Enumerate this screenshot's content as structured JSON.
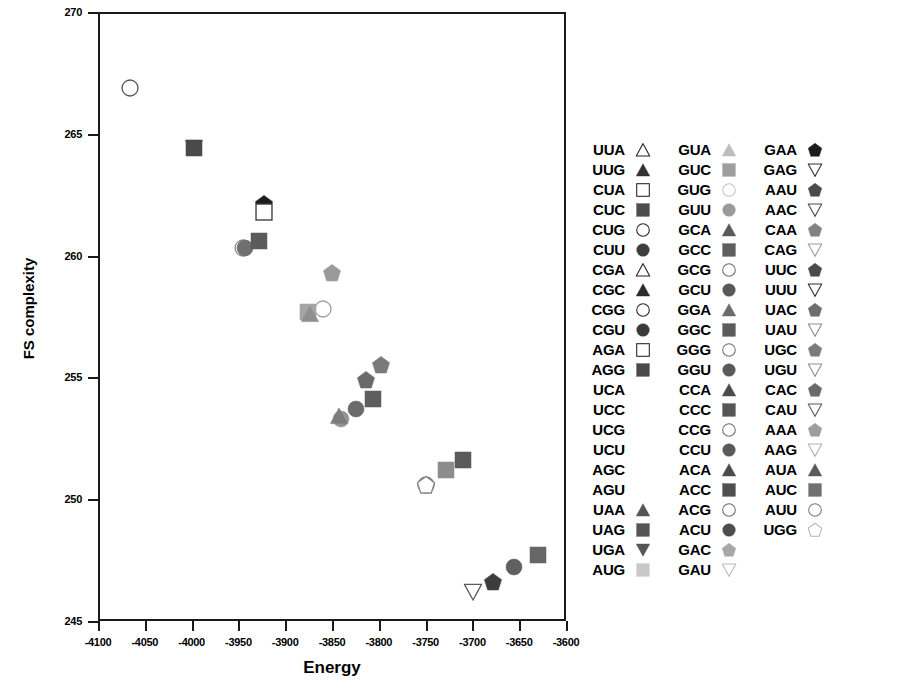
{
  "chart_data": {
    "type": "scatter",
    "title": "",
    "xlabel": "Energy",
    "ylabel": "FS complexity",
    "xlim": [
      -4100,
      -3600
    ],
    "ylim": [
      245,
      270
    ],
    "xticks": [
      -4100,
      -4050,
      -4000,
      -3950,
      -3900,
      -3850,
      -3800,
      -3750,
      -3700,
      -3650,
      -3600
    ],
    "yticks": [
      245,
      250,
      255,
      260,
      265,
      270
    ],
    "grid": false,
    "legend_position": "right",
    "points": [
      {
        "label": "CUG",
        "x": -4068,
        "y": 266.9,
        "shape": "circle-open",
        "color": "#555555"
      },
      {
        "label": "UGA",
        "x": -4000,
        "y": 264.4,
        "shape": "triangle-down",
        "color": "#4a4a4a"
      },
      {
        "label": "UAG",
        "x": -4000,
        "y": 264.4,
        "shape": "square",
        "color": "#4a4a4a"
      },
      {
        "label": "GAA",
        "x": -3925,
        "y": 262.1,
        "shape": "pentagon",
        "color": "#1c1c1c"
      },
      {
        "label": "CUA",
        "x": -3925,
        "y": 261.8,
        "shape": "square-open",
        "color": "#3a3a3a"
      },
      {
        "label": "GCA",
        "x": -3947,
        "y": 260.3,
        "shape": "circle-open",
        "color": "#8a8a8a"
      },
      {
        "label": "AAC",
        "x": -3945,
        "y": 260.3,
        "shape": "circle",
        "color": "#6f6f6f"
      },
      {
        "label": "CUC",
        "x": -3930,
        "y": 260.6,
        "shape": "square",
        "color": "#5b5b5b"
      },
      {
        "label": "GAU",
        "x": -3852,
        "y": 259.3,
        "shape": "pentagon",
        "color": "#9a9a9a"
      },
      {
        "label": "AAU",
        "x": -3862,
        "y": 257.8,
        "shape": "circle-open",
        "color": "#9d9d9d"
      },
      {
        "label": "GAC",
        "x": -3878,
        "y": 257.7,
        "shape": "square",
        "color": "#a5a5a5"
      },
      {
        "label": "ACG",
        "x": -3876,
        "y": 257.6,
        "shape": "triangle-up",
        "color": "#8f8f8f"
      },
      {
        "label": "CAA",
        "x": -3800,
        "y": 255.5,
        "shape": "pentagon",
        "color": "#7a7a7a"
      },
      {
        "label": "UUC",
        "x": -3816,
        "y": 254.9,
        "shape": "pentagon",
        "color": "#6a6a6a"
      },
      {
        "label": "GUU",
        "x": -3808,
        "y": 254.1,
        "shape": "square",
        "color": "#5e5e5e"
      },
      {
        "label": "UAC",
        "x": -3826,
        "y": 253.7,
        "shape": "circle",
        "color": "#6b6b6b"
      },
      {
        "label": "UGU",
        "x": -3842,
        "y": 253.3,
        "shape": "circle",
        "color": "#969696"
      },
      {
        "label": "CAG",
        "x": -3845,
        "y": 253.4,
        "shape": "triangle-up",
        "color": "#7d7d7d"
      },
      {
        "label": "AUC",
        "x": -3712,
        "y": 251.6,
        "shape": "square",
        "color": "#5a5a5a"
      },
      {
        "label": "AAG",
        "x": -3730,
        "y": 251.2,
        "shape": "square",
        "color": "#8c8c8c"
      },
      {
        "label": "AUU",
        "x": -3752,
        "y": 250.6,
        "shape": "circle-open",
        "color": "#707070"
      },
      {
        "label": "UGG",
        "x": -3752,
        "y": 250.6,
        "shape": "pentagon-open",
        "color": "#888888"
      },
      {
        "label": "UUU",
        "x": -3632,
        "y": 247.7,
        "shape": "square",
        "color": "#666666"
      },
      {
        "label": "AUA",
        "x": -3658,
        "y": 247.2,
        "shape": "circle",
        "color": "#606060"
      },
      {
        "label": "CAC",
        "x": -3680,
        "y": 246.6,
        "shape": "pentagon",
        "color": "#3c3c3c"
      },
      {
        "label": "GAG",
        "x": -3702,
        "y": 246.2,
        "shape": "triangle-down-open",
        "color": "#5a5a5a"
      }
    ]
  },
  "legend": {
    "columns": [
      {
        "rows": [
          {
            "label": "UUA",
            "shape": "triangle-up-open",
            "color": "#222222"
          },
          {
            "label": "UUG",
            "shape": "triangle-up",
            "color": "#333333"
          },
          {
            "label": "CUA",
            "shape": "square-open",
            "color": "#222222"
          },
          {
            "label": "CUC",
            "shape": "square",
            "color": "#4d4d4d"
          },
          {
            "label": "CUG",
            "shape": "circle-open",
            "color": "#222222"
          },
          {
            "label": "CUU",
            "shape": "circle",
            "color": "#3d3d3d"
          },
          {
            "label": "CGA",
            "shape": "triangle-up-open",
            "color": "#222222"
          },
          {
            "label": "CGC",
            "shape": "triangle-up",
            "color": "#2b2b2b"
          },
          {
            "label": "CGG",
            "shape": "circle-open",
            "color": "#222222"
          },
          {
            "label": "CGU",
            "shape": "circle",
            "color": "#3a3a3a"
          },
          {
            "label": "AGA",
            "shape": "square-open",
            "color": "#222222"
          },
          {
            "label": "AGG",
            "shape": "square",
            "color": "#4a4a4a"
          },
          {
            "label": "UCA",
            "shape": "none",
            "color": "#000000"
          },
          {
            "label": "UCC",
            "shape": "none",
            "color": "#000000"
          },
          {
            "label": "UCG",
            "shape": "none",
            "color": "#000000"
          },
          {
            "label": "UCU",
            "shape": "none",
            "color": "#000000"
          },
          {
            "label": "AGC",
            "shape": "none",
            "color": "#000000"
          },
          {
            "label": "AGU",
            "shape": "none",
            "color": "#000000"
          },
          {
            "label": "UAA",
            "shape": "triangle-up",
            "color": "#555555"
          },
          {
            "label": "UAG",
            "shape": "square",
            "color": "#555555"
          },
          {
            "label": "UGA",
            "shape": "triangle-down",
            "color": "#555555"
          },
          {
            "label": "AUG",
            "shape": "square",
            "color": "#c8c8c8"
          }
        ]
      },
      {
        "rows": [
          {
            "label": "GUA",
            "shape": "triangle-up",
            "color": "#bdbdbd"
          },
          {
            "label": "GUC",
            "shape": "square",
            "color": "#9e9e9e"
          },
          {
            "label": "GUG",
            "shape": "circle-open",
            "color": "#c4c4c4"
          },
          {
            "label": "GUU",
            "shape": "circle",
            "color": "#9a9a9a"
          },
          {
            "label": "GCA",
            "shape": "triangle-up",
            "color": "#5a5a5a"
          },
          {
            "label": "GCC",
            "shape": "square",
            "color": "#5e5e5e"
          },
          {
            "label": "GCG",
            "shape": "circle-open",
            "color": "#6a6a6a"
          },
          {
            "label": "GCU",
            "shape": "circle",
            "color": "#585858"
          },
          {
            "label": "GGA",
            "shape": "triangle-up",
            "color": "#6b6b6b"
          },
          {
            "label": "GGC",
            "shape": "square",
            "color": "#5c5c5c"
          },
          {
            "label": "GGG",
            "shape": "circle-open",
            "color": "#707070"
          },
          {
            "label": "GGU",
            "shape": "circle",
            "color": "#5a5a5a"
          },
          {
            "label": "CCA",
            "shape": "triangle-up",
            "color": "#4a4a4a"
          },
          {
            "label": "CCC",
            "shape": "square",
            "color": "#565656"
          },
          {
            "label": "CCG",
            "shape": "circle-open",
            "color": "#6e6e6e"
          },
          {
            "label": "CCU",
            "shape": "circle",
            "color": "#5a5a5a"
          },
          {
            "label": "ACA",
            "shape": "triangle-up",
            "color": "#4a4a4a"
          },
          {
            "label": "ACC",
            "shape": "square",
            "color": "#4f4f4f"
          },
          {
            "label": "ACG",
            "shape": "circle-open",
            "color": "#6a6a6a"
          },
          {
            "label": "ACU",
            "shape": "circle",
            "color": "#4d4d4d"
          },
          {
            "label": "GAC",
            "shape": "pentagon",
            "color": "#a8a8a8"
          },
          {
            "label": "GAU",
            "shape": "triangle-down-open",
            "color": "#bcbcbc"
          }
        ]
      },
      {
        "rows": [
          {
            "label": "GAA",
            "shape": "pentagon",
            "color": "#1c1c1c"
          },
          {
            "label": "GAG",
            "shape": "triangle-down-open",
            "color": "#333333"
          },
          {
            "label": "AAU",
            "shape": "pentagon",
            "color": "#4a4a4a"
          },
          {
            "label": "AAC",
            "shape": "triangle-down-open",
            "color": "#4a4a4a"
          },
          {
            "label": "CAA",
            "shape": "pentagon",
            "color": "#828282"
          },
          {
            "label": "CAG",
            "shape": "triangle-down-open",
            "color": "#9a9a9a"
          },
          {
            "label": "UUC",
            "shape": "pentagon",
            "color": "#4a4a4a"
          },
          {
            "label": "UUU",
            "shape": "triangle-down-open",
            "color": "#2f2f2f"
          },
          {
            "label": "UAC",
            "shape": "pentagon",
            "color": "#6d6d6d"
          },
          {
            "label": "UAU",
            "shape": "triangle-down-open",
            "color": "#8c8c8c"
          },
          {
            "label": "UGC",
            "shape": "pentagon",
            "color": "#7b7b7b"
          },
          {
            "label": "UGU",
            "shape": "triangle-down-open",
            "color": "#909090"
          },
          {
            "label": "CAC",
            "shape": "pentagon",
            "color": "#6a6a6a"
          },
          {
            "label": "CAU",
            "shape": "triangle-down-open",
            "color": "#5a5a5a"
          },
          {
            "label": "AAA",
            "shape": "pentagon",
            "color": "#9d9d9d"
          },
          {
            "label": "AAG",
            "shape": "triangle-down-open",
            "color": "#b0b0b0"
          },
          {
            "label": "AUA",
            "shape": "triangle-up",
            "color": "#5a5a5a"
          },
          {
            "label": "AUC",
            "shape": "square",
            "color": "#707070"
          },
          {
            "label": "AUU",
            "shape": "circle-open",
            "color": "#7a7a7a"
          },
          {
            "label": "UGG",
            "shape": "pentagon-open",
            "color": "#b4b4b4"
          }
        ]
      }
    ]
  }
}
